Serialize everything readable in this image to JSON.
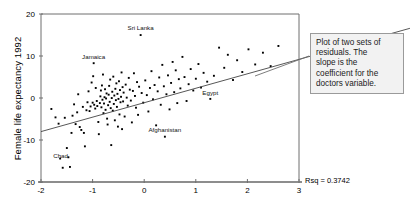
{
  "chart_data": {
    "type": "scatter",
    "title": "",
    "xlabel": "",
    "ylabel": "Female life expectancy 1992",
    "xlim": [
      -2,
      3
    ],
    "ylim": [
      -20,
      20
    ],
    "xticks": [
      "-2",
      "-1",
      "0",
      "1",
      "2",
      "3"
    ],
    "xtick_values": [
      -2,
      -1,
      0,
      1,
      2,
      3
    ],
    "yticks": [
      "20",
      "10",
      "0",
      "-10",
      "-20"
    ],
    "ytick_values": [
      20,
      10,
      0,
      -10,
      -20
    ],
    "grid": false,
    "legend": "none",
    "point_color": "#000000",
    "line_color": "#444444",
    "fit_line": {
      "label": "regression line",
      "x": [
        -2.0,
        3.0
      ],
      "y": [
        -8.0,
        9.2
      ],
      "slope": 3.44,
      "intercept": -1.12
    },
    "annotations": [
      {
        "text": "Sri Lanka",
        "x": -0.07,
        "y": 16.1
      },
      {
        "text": "Jamaica",
        "x": -0.98,
        "y": 9.2
      },
      {
        "text": "Egypt",
        "x": 1.28,
        "y": 0.6
      },
      {
        "text": "Afghanistan",
        "x": 0.4,
        "y": -8.1
      },
      {
        "text": "Chad",
        "x": -1.62,
        "y": -14.2
      }
    ],
    "points": [
      [
        -1.8,
        -2.6
      ],
      [
        -1.72,
        -4.6
      ],
      [
        -1.66,
        -6.1
      ],
      [
        -1.63,
        -14.4
      ],
      [
        -1.58,
        -16.6
      ],
      [
        -1.54,
        -4.7
      ],
      [
        -1.5,
        -11.9
      ],
      [
        -1.47,
        -14.1
      ],
      [
        -1.44,
        -16.4
      ],
      [
        -1.41,
        -8.3
      ],
      [
        -1.39,
        -4.2
      ],
      [
        -1.36,
        -1.5
      ],
      [
        -1.33,
        -6.2
      ],
      [
        -1.3,
        -3.4
      ],
      [
        -1.28,
        0.9
      ],
      [
        -1.25,
        -6.9
      ],
      [
        -1.22,
        -7.6
      ],
      [
        -1.19,
        -2.1
      ],
      [
        -1.17,
        -8.3
      ],
      [
        -1.15,
        -11.5
      ],
      [
        -1.12,
        -2.9
      ],
      [
        -1.1,
        -1.0
      ],
      [
        -1.08,
        1.6
      ],
      [
        -1.06,
        -3.1
      ],
      [
        -1.04,
        -2.0
      ],
      [
        -1.02,
        3.7
      ],
      [
        -1.0,
        -1.1
      ],
      [
        -0.99,
        5.2
      ],
      [
        -0.98,
        8.3
      ],
      [
        -0.97,
        -1.6
      ],
      [
        -0.95,
        -2.5
      ],
      [
        -0.94,
        2.4
      ],
      [
        -0.92,
        -0.7
      ],
      [
        -0.91,
        -1.9
      ],
      [
        -0.89,
        -5.7
      ],
      [
        -0.88,
        -8.6
      ],
      [
        -0.86,
        -1.2
      ],
      [
        -0.85,
        0.4
      ],
      [
        -0.84,
        1.8
      ],
      [
        -0.83,
        -2.2
      ],
      [
        -0.82,
        3.0
      ],
      [
        -0.81,
        -0.4
      ],
      [
        -0.8,
        5.6
      ],
      [
        -0.79,
        -3.6
      ],
      [
        -0.78,
        -1.3
      ],
      [
        -0.77,
        0.2
      ],
      [
        -0.76,
        2.1
      ],
      [
        -0.75,
        -2.8
      ],
      [
        -0.74,
        -0.1
      ],
      [
        -0.73,
        1.1
      ],
      [
        -0.72,
        -4.9
      ],
      [
        -0.71,
        -6.3
      ],
      [
        -0.7,
        -1.7
      ],
      [
        -0.69,
        0.8
      ],
      [
        -0.68,
        2.9
      ],
      [
        -0.67,
        -0.9
      ],
      [
        -0.66,
        4.4
      ],
      [
        -0.65,
        -2.4
      ],
      [
        -0.64,
        -11.2
      ],
      [
        -0.63,
        0.0
      ],
      [
        -0.62,
        1.5
      ],
      [
        -0.61,
        -3.0
      ],
      [
        -0.6,
        5.1
      ],
      [
        -0.59,
        -1.4
      ],
      [
        -0.58,
        0.6
      ],
      [
        -0.57,
        -5.3
      ],
      [
        -0.56,
        2.2
      ],
      [
        -0.55,
        -0.5
      ],
      [
        -0.54,
        3.5
      ],
      [
        -0.53,
        -2.1
      ],
      [
        -0.52,
        1.0
      ],
      [
        -0.51,
        -6.8
      ],
      [
        -0.5,
        -0.2
      ],
      [
        -0.49,
        4.0
      ],
      [
        -0.48,
        -3.9
      ],
      [
        -0.47,
        1.9
      ],
      [
        -0.46,
        -1.0
      ],
      [
        -0.45,
        0.3
      ],
      [
        -0.44,
        6.1
      ],
      [
        -0.43,
        -7.4
      ],
      [
        -0.42,
        2.6
      ],
      [
        -0.41,
        -0.8
      ],
      [
        -0.4,
        1.3
      ],
      [
        -0.38,
        -4.4
      ],
      [
        -0.36,
        3.2
      ],
      [
        -0.34,
        0.1
      ],
      [
        -0.32,
        -1.8
      ],
      [
        -0.3,
        4.8
      ],
      [
        -0.28,
        2.0
      ],
      [
        -0.26,
        -0.6
      ],
      [
        -0.24,
        -5.8
      ],
      [
        -0.22,
        1.7
      ],
      [
        -0.2,
        5.9
      ],
      [
        -0.18,
        0.5
      ],
      [
        -0.16,
        -2.3
      ],
      [
        -0.14,
        3.8
      ],
      [
        -0.12,
        -4.0
      ],
      [
        -0.1,
        2.7
      ],
      [
        -0.07,
        15.0
      ],
      [
        -0.05,
        1.2
      ],
      [
        -0.02,
        -1.1
      ],
      [
        0.02,
        4.2
      ],
      [
        0.05,
        0.7
      ],
      [
        0.08,
        -3.2
      ],
      [
        0.11,
        2.4
      ],
      [
        0.14,
        6.4
      ],
      [
        0.17,
        -0.3
      ],
      [
        0.2,
        3.1
      ],
      [
        0.23,
        -6.5
      ],
      [
        0.26,
        1.6
      ],
      [
        0.29,
        4.9
      ],
      [
        0.32,
        -1.6
      ],
      [
        0.35,
        7.9
      ],
      [
        0.38,
        2.8
      ],
      [
        0.4,
        -9.2
      ],
      [
        0.43,
        0.9
      ],
      [
        0.46,
        5.4
      ],
      [
        0.49,
        -2.7
      ],
      [
        0.52,
        3.6
      ],
      [
        0.55,
        8.6
      ],
      [
        0.58,
        1.4
      ],
      [
        0.61,
        6.6
      ],
      [
        0.64,
        -1.2
      ],
      [
        0.67,
        4.5
      ],
      [
        0.7,
        2.3
      ],
      [
        0.74,
        9.8
      ],
      [
        0.78,
        5.0
      ],
      [
        0.82,
        -0.7
      ],
      [
        0.86,
        3.3
      ],
      [
        0.9,
        6.9
      ],
      [
        0.95,
        1.8
      ],
      [
        1.0,
        4.6
      ],
      [
        1.05,
        8.1
      ],
      [
        1.1,
        2.5
      ],
      [
        1.15,
        6.0
      ],
      [
        1.22,
        3.9
      ],
      [
        1.28,
        -0.2
      ],
      [
        1.35,
        5.3
      ],
      [
        1.45,
        12.0
      ],
      [
        1.55,
        7.2
      ],
      [
        1.62,
        10.3
      ],
      [
        1.72,
        4.3
      ],
      [
        1.8,
        9.0
      ],
      [
        1.9,
        6.2
      ],
      [
        2.02,
        11.6
      ],
      [
        2.15,
        8.0
      ],
      [
        2.3,
        10.8
      ],
      [
        2.45,
        7.6
      ],
      [
        2.6,
        12.4
      ]
    ]
  },
  "callout": {
    "lines": [
      "Plot of two sets of",
      "residuals. The",
      "slope is the",
      "coefficient for the",
      "doctors variable."
    ],
    "full_text": "Plot of two sets of residuals. The slope is the coefficient for the doctors variable."
  },
  "stats": {
    "rsq_label": "Rsq = 0.3742"
  },
  "colors": {
    "background": "#ffffff",
    "point": "#000000",
    "axis": "#6e6e6e",
    "fit_line": "#4a4a4a",
    "callout_border": "#9a9a9a",
    "callout_fill": "#f2f2f2"
  }
}
